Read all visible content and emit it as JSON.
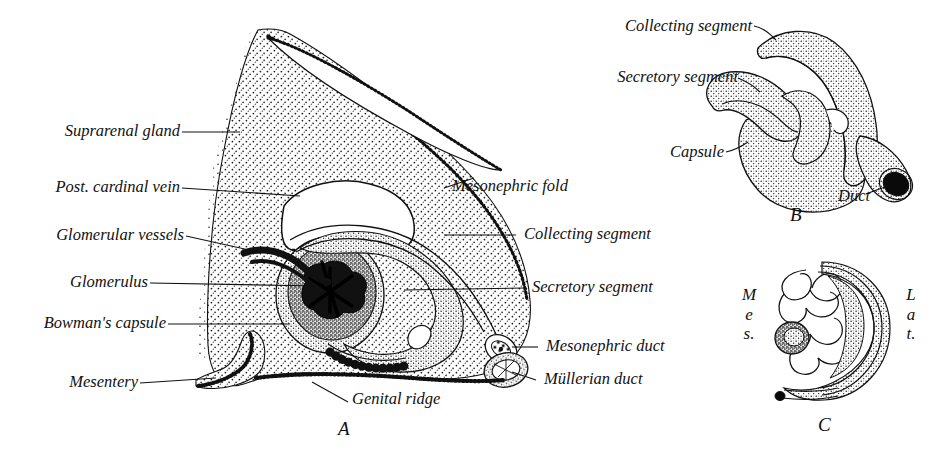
{
  "figure": {
    "kind": "anatomical-line-drawing",
    "background_color": "#ffffff",
    "ink_color": "#111111"
  },
  "panel_a": {
    "letter": "A",
    "labels_left": [
      {
        "id": "suprarenal-gland",
        "text": "Suprarenal gland"
      },
      {
        "id": "post-cardinal-vein",
        "text": "Post. cardinal vein"
      },
      {
        "id": "glomerular-vessels",
        "text": "Glomerular vessels"
      },
      {
        "id": "glomerulus",
        "text": "Glomerulus"
      },
      {
        "id": "bowmans-capsule",
        "text": "Bowman's capsule"
      },
      {
        "id": "mesentery",
        "text": "Mesentery"
      }
    ],
    "labels_right": [
      {
        "id": "mesonephric-fold",
        "text": "Mesonephric fold"
      },
      {
        "id": "collecting-segment",
        "text": "Collecting segment"
      },
      {
        "id": "secretory-segment",
        "text": "Secretory segment"
      },
      {
        "id": "mesonephric-duct",
        "text": "Mesonephric duct"
      },
      {
        "id": "mullerian-duct",
        "text": "Müllerian duct"
      }
    ],
    "labels_bottom": [
      {
        "id": "genital-ridge",
        "text": "Genital ridge"
      }
    ]
  },
  "panel_b": {
    "letter": "B",
    "labels": [
      {
        "id": "collecting-segment",
        "text": "Collecting segment"
      },
      {
        "id": "secretory-segment",
        "text": "Secretory segment"
      },
      {
        "id": "capsule",
        "text": "Capsule"
      },
      {
        "id": "duct",
        "text": "Duct"
      }
    ]
  },
  "panel_c": {
    "letter": "C",
    "orientation_left": {
      "id": "medial",
      "lines": [
        "M",
        "e",
        "s."
      ]
    },
    "orientation_right": {
      "id": "lateral",
      "lines": [
        "L",
        "a",
        "t."
      ]
    }
  }
}
